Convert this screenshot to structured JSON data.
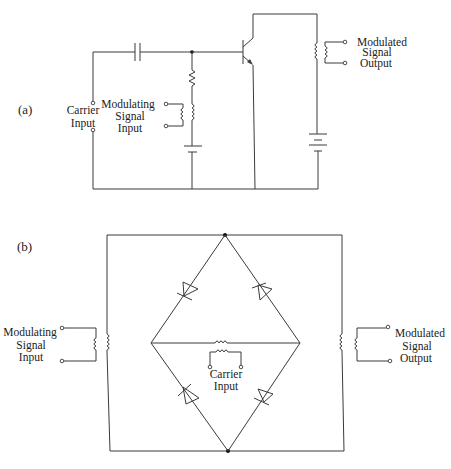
{
  "figure": {
    "panel_a": {
      "label": "(a)",
      "carrier_input": [
        "Carrier",
        "Input"
      ],
      "modulating_input": [
        "Modulating",
        "Signal",
        "Input"
      ],
      "modulated_output": [
        "Modulated",
        "Signal",
        "Output"
      ],
      "components": [
        "capacitor",
        "resistor",
        "transformer",
        "battery",
        "npn-transistor",
        "output-transformer",
        "battery"
      ]
    },
    "panel_b": {
      "label": "(b)",
      "modulating_input": [
        "Modulating",
        "Signal",
        "Input"
      ],
      "carrier_input": [
        "Carrier",
        "Input"
      ],
      "modulated_output": [
        "Modulated",
        "Signal",
        "Output"
      ],
      "components": [
        "input-transformer",
        "diode-bridge",
        "carrier-transformer",
        "output-transformer"
      ]
    },
    "colors": {
      "line": "#3a3a3a",
      "text": "#222222",
      "background": "#ffffff"
    }
  }
}
